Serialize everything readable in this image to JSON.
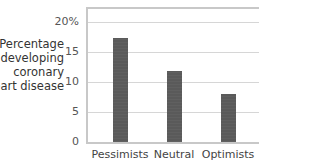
{
  "chart_data": {
    "type": "bar",
    "title": "",
    "xlabel": "",
    "ylabel": "Percentage developing coronary heart disease",
    "ylabel_lines": [
      "Percentage",
      "developing",
      "coronary",
      "heart disease"
    ],
    "categories": [
      "Pessimists",
      "Neutral",
      "Optimists"
    ],
    "values": [
      17.3,
      11.8,
      8.0
    ],
    "ylim": [
      0,
      20
    ],
    "yticks": [
      0,
      5,
      10,
      15,
      20
    ],
    "ytick_labels": [
      "0",
      "5",
      "10",
      "15",
      "20%"
    ],
    "grid": true,
    "legend": null,
    "bar_color": "#5a5a5a"
  }
}
